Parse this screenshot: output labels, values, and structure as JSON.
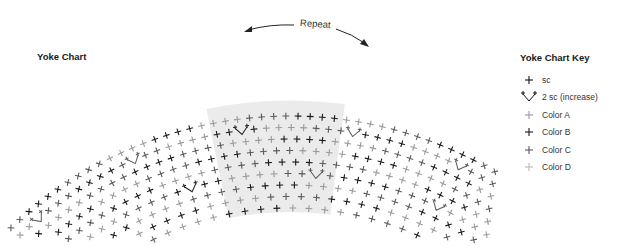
{
  "chart_title": "Yoke Chart",
  "repeat_label": "Repeat",
  "key": {
    "title": "Yoke Chart Key",
    "items": [
      {
        "symbol": "sc",
        "label": "sc",
        "color": "#111111"
      },
      {
        "symbol": "inc",
        "label": "2 sc (increase)",
        "color": "#111111"
      },
      {
        "symbol": "sc",
        "label": "Color A",
        "color": "#9a9a9a"
      },
      {
        "symbol": "sc",
        "label": "Color B",
        "color": "#1a1a1a"
      },
      {
        "symbol": "sc",
        "label": "Color C",
        "color": "#5a5a5a"
      },
      {
        "symbol": "sc",
        "label": "Color D",
        "color": "#b8b8b8"
      }
    ]
  },
  "colors": {
    "A": "#9a9a9a",
    "B": "#1a1a1a",
    "C": "#5a5a5a",
    "D": "#b8b8b8",
    "repeat_shade": "#ebebeb"
  },
  "rows": [
    "1",
    "2",
    "3",
    "4",
    "5",
    "6",
    "7",
    "8",
    "9"
  ],
  "row_color_pattern": [
    "B",
    "C",
    "A",
    "B",
    "A",
    "C",
    "B",
    "A",
    "C"
  ]
}
